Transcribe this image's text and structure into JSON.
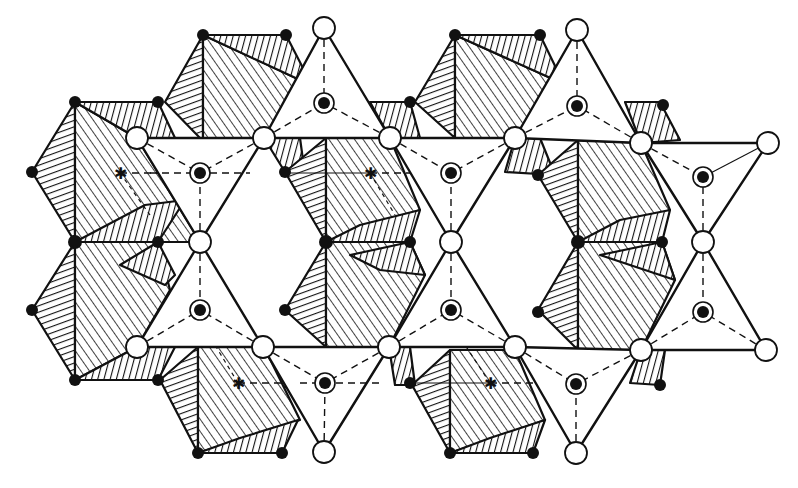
{
  "diagram": {
    "title": "",
    "kind": "crystal-structure-polyhedra",
    "colors": {
      "line": "#111111",
      "background": "#ffffff",
      "open_atom": "#ffffff",
      "solid_atom": "#111111"
    },
    "legend": [],
    "labels": [],
    "counts": {
      "tetrahedra": 10,
      "octahedral_columns": 6,
      "open_atoms": 19,
      "center_markers": 4
    }
  }
}
